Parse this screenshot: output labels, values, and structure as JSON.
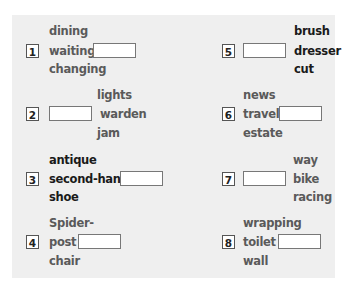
{
  "exercise": {
    "items": [
      {
        "number": "1",
        "words": [
          "dining",
          "waiting",
          "changing"
        ],
        "answer": ""
      },
      {
        "number": "2",
        "words": [
          "lights",
          "warden",
          "jam"
        ],
        "answer": ""
      },
      {
        "number": "3",
        "words": [
          "antique",
          "second-hand",
          "shoe"
        ],
        "answer": ""
      },
      {
        "number": "4",
        "words": [
          "Spider-",
          "post",
          "chair"
        ],
        "answer": ""
      },
      {
        "number": "5",
        "words": [
          "brush",
          "dresser",
          "cut"
        ],
        "answer": ""
      },
      {
        "number": "6",
        "words": [
          "news",
          "travel",
          "estate"
        ],
        "answer": ""
      },
      {
        "number": "7",
        "words": [
          "way",
          "bike",
          "racing"
        ],
        "answer": ""
      },
      {
        "number": "8",
        "words": [
          "wrapping",
          "toilet",
          "wall"
        ],
        "answer": ""
      }
    ]
  }
}
